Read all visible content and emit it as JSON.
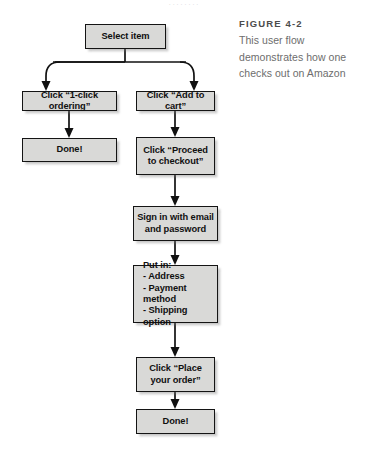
{
  "page": {
    "top_sliver_text": "........"
  },
  "caption": {
    "figure_label": "FIGURE 4-2",
    "lines": [
      "This user flow",
      "demonstrates how one",
      "checks out on Amazon"
    ]
  },
  "flow": {
    "title": "Amazon checkout user flow",
    "nodes": [
      {
        "id": "select-item",
        "label": "Select item",
        "lines": [
          "Select item"
        ]
      },
      {
        "id": "one-click",
        "label": "Click “1-click ordering”",
        "lines": [
          "Click “1-click ordering”"
        ]
      },
      {
        "id": "add-to-cart",
        "label": "Click “Add to cart”",
        "lines": [
          "Click “Add to cart”"
        ]
      },
      {
        "id": "done-left",
        "label": "Done!",
        "lines": [
          "Done!"
        ]
      },
      {
        "id": "proceed",
        "label": "Click “Proceed to checkout”",
        "lines": [
          "Click “Proceed",
          "to checkout”"
        ]
      },
      {
        "id": "sign-in",
        "label": "Sign in with email and password",
        "lines": [
          "Sign in with email",
          "and password"
        ]
      },
      {
        "id": "put-in",
        "label": "Put in: Address, Payment method, Shipping option",
        "lines": [
          "Put in:",
          "- Address",
          "- Payment method",
          "- Shipping option"
        ]
      },
      {
        "id": "place-order",
        "label": "Click “Place your order”",
        "lines": [
          "Click “Place",
          "your order”"
        ]
      },
      {
        "id": "done-bottom",
        "label": "Done!",
        "lines": [
          "Done!"
        ]
      }
    ],
    "colors": {
      "node_fill": "#d9d9d7",
      "node_border": "#141414",
      "connector": "#111111",
      "caption_title": "#4c4c4c",
      "caption_body": "#6d6d6d",
      "background": "#ffffff"
    }
  }
}
